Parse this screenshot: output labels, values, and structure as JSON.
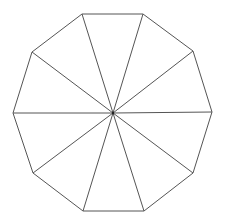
{
  "diagram": {
    "shape": "decagon",
    "sides": 10,
    "stroke_color": "#555555",
    "fill_color": "#ffffff",
    "stroke_width": 1,
    "center": [
      113,
      113
    ],
    "vertices": [
      [
        82,
        14
      ],
      [
        143,
        14
      ],
      [
        193,
        51
      ],
      [
        212,
        112
      ],
      [
        193,
        173
      ],
      [
        144,
        211
      ],
      [
        83,
        211
      ],
      [
        33,
        173
      ],
      [
        13,
        113
      ],
      [
        32,
        52
      ]
    ]
  }
}
